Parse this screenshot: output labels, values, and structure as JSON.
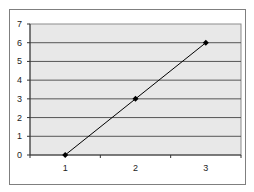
{
  "chart_data": {
    "type": "line",
    "title": "",
    "xlabel": "",
    "ylabel": "",
    "categories": [
      "1",
      "2",
      "3"
    ],
    "series": [
      {
        "name": "Series 1",
        "values": [
          0,
          3,
          6
        ],
        "color": "#000000",
        "marker": "diamond"
      }
    ],
    "ylim": [
      0,
      7
    ],
    "yticks": [
      "0",
      "1",
      "2",
      "3",
      "4",
      "5",
      "6",
      "7"
    ],
    "grid": true,
    "legend": "none",
    "plot_background": "#e8e8e8"
  }
}
